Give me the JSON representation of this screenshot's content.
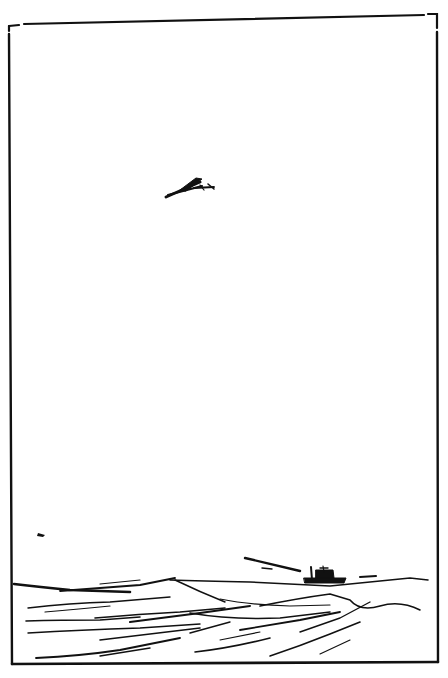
{
  "illustration": {
    "subject": "Pen-and-ink sketch of a biplane flying over rough sea with a distant ship",
    "style": "black ink line drawing on white",
    "colors": {
      "ink": "#111111",
      "paper": "#ffffff"
    },
    "elements": {
      "airplane": "biplane in sky, upper middle",
      "ship": "small steamship on horizon, right",
      "sea": "choppy waves across bottom",
      "bird": "small dark mark left, above horizon",
      "frame": "hand-drawn rectangular border"
    }
  }
}
